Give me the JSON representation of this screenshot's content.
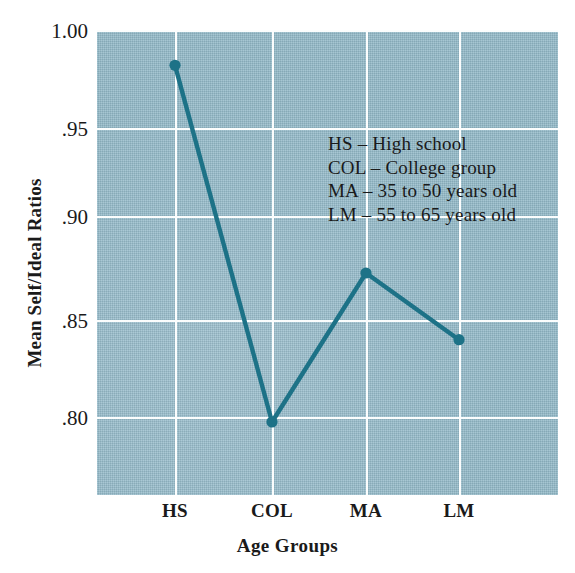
{
  "chart_data": {
    "type": "line",
    "title": "",
    "xlabel": "Age Groups",
    "ylabel": "Mean Self/Ideal Ratios",
    "categories": [
      "HS",
      "COL",
      "MA",
      "LM"
    ],
    "values": [
      0.982,
      0.8,
      0.876,
      0.842
    ],
    "series": [
      {
        "name": "Mean Self/Ideal Ratios",
        "values": [
          0.982,
          0.8,
          0.876,
          0.842
        ],
        "color": "#1d7287",
        "marker": "circle"
      }
    ],
    "ylim": [
      0.7665,
      1.0
    ],
    "yticks": [
      1.0,
      0.95,
      0.9,
      0.85,
      0.8
    ],
    "ytick_labels": [
      "1.00",
      ".95",
      ".90",
      ".85",
      ".80"
    ],
    "xtick_labels": [
      "HS",
      "COL",
      "MA",
      "LM"
    ],
    "grid": true,
    "grid_color": "#fbfdfd",
    "plot_background": "#92b9c8",
    "legend_position": "inside-upper-right",
    "annotations": [
      "HS – High school",
      "COL – College group",
      "MA – 35 to 50 years old",
      "LM – 55 to 65 years old"
    ]
  },
  "legend": {
    "lines": [
      "HS – High school",
      "COL – College group",
      "MA – 35 to 50 years old",
      "LM – 55 to 65 years old"
    ]
  },
  "axes": {
    "y_title": "Mean Self/Ideal Ratios",
    "x_title": "Age Groups",
    "y_labels": [
      "1.00",
      ".95",
      ".90",
      ".85",
      ".80"
    ],
    "x_labels": [
      "HS",
      "COL",
      "MA",
      "LM"
    ]
  }
}
